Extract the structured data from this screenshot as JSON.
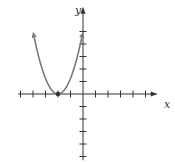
{
  "chart_data": {
    "type": "line",
    "title": "",
    "xlabel": "x",
    "ylabel": "y",
    "function": "y = (5/4)(x + 2)^2",
    "xlim": [
      -5.2,
      5.5
    ],
    "ylim": [
      -5.3,
      6.5
    ],
    "x_ticks": [
      -5,
      -4,
      -3,
      -2,
      -1,
      1,
      2,
      3,
      4,
      5
    ],
    "y_ticks": [
      -5,
      -4,
      -3,
      -2,
      -1,
      1,
      2,
      3,
      4,
      5
    ],
    "grid": false,
    "legend": null,
    "series": [
      {
        "name": "parabola",
        "color": "#7a7a7a",
        "x": [
          -3.9,
          -3.5,
          -3,
          -2.5,
          -2,
          -1.5,
          -1,
          -0.5,
          -0.1
        ],
        "y": [
          4.5,
          2.81,
          1.25,
          0.31,
          0,
          0.31,
          1.25,
          2.81,
          4.5
        ]
      }
    ],
    "annotations": [
      {
        "type": "point",
        "x": -2,
        "y": 0,
        "label": "vertex"
      }
    ]
  },
  "axes": {
    "x_label": "x",
    "y_label": "y",
    "axis_color": "#333333"
  }
}
